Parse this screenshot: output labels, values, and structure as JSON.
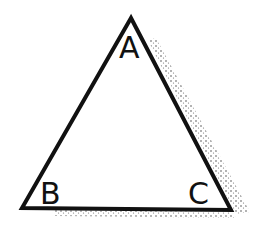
{
  "diagram": {
    "type": "triangle",
    "vertices": {
      "A": {
        "label": "A",
        "x": 131,
        "y": 18
      },
      "B": {
        "label": "B",
        "x": 22,
        "y": 208
      },
      "C": {
        "label": "C",
        "x": 231,
        "y": 210
      }
    },
    "colors": {
      "stroke": "#111111",
      "shadow": "#555555",
      "background": "#ffffff"
    }
  }
}
